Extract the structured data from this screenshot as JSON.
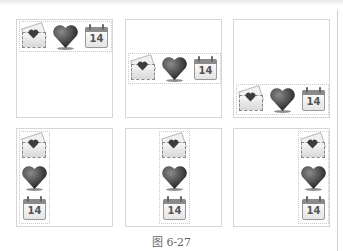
{
  "figure": {
    "caption": "图 6-27",
    "panels": [
      {
        "id": "top-left",
        "layout": "horizontal",
        "align": "top-left"
      },
      {
        "id": "top-center",
        "layout": "horizontal",
        "align": "middle-left"
      },
      {
        "id": "top-right",
        "layout": "horizontal",
        "align": "bottom-left"
      },
      {
        "id": "bottom-left",
        "layout": "vertical",
        "align": "left"
      },
      {
        "id": "bottom-center",
        "layout": "vertical",
        "align": "center"
      },
      {
        "id": "bottom-right",
        "layout": "vertical",
        "align": "right"
      }
    ],
    "icons": [
      {
        "name": "envelope-heart-icon"
      },
      {
        "name": "heart-icon"
      },
      {
        "name": "calendar-icon",
        "text": "14"
      }
    ],
    "calendar_day": "14",
    "colors": {
      "border": "#d6d6d6",
      "icon_dark": "#3a3a3a",
      "caption": "#666666"
    }
  }
}
